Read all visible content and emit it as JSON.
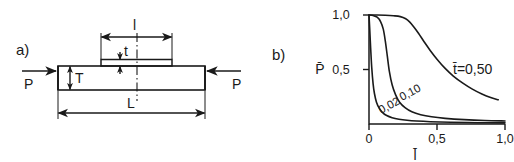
{
  "figure": {
    "panels": [
      {
        "tag": "a)",
        "kind": "engineering-diagram",
        "description": "Bar loaded in compression with a raised strip on the top surface",
        "labels": {
          "load_left": "P",
          "load_right": "P",
          "bar_thickness": "T",
          "strip_thickness": "t",
          "strip_length": "l",
          "bar_length": "L"
        }
      },
      {
        "tag": "b)",
        "kind": "line-chart"
      }
    ]
  },
  "chart_data": {
    "type": "line",
    "title": "",
    "xlabel": "l̄",
    "ylabel": "P̄",
    "xlim": [
      0,
      1.0
    ],
    "ylim": [
      0,
      1.0
    ],
    "grid": false,
    "legend_position": "inline-annotations",
    "xticks": [
      0,
      0.5,
      1.0
    ],
    "xtick_labels": [
      "0",
      "0,5",
      "1,0"
    ],
    "yticks": [
      0.5,
      1.0
    ],
    "ytick_labels": [
      "0,5",
      "1,0"
    ],
    "series": [
      {
        "name": "t̄ = 0,02",
        "annotation": "0,02",
        "x": [
          0.0,
          0.005,
          0.012,
          0.02,
          0.03,
          0.04,
          0.055,
          0.075,
          0.1,
          0.13,
          0.17,
          0.22,
          0.28,
          0.35,
          0.45,
          0.6,
          0.8,
          1.0
        ],
        "y": [
          1.0,
          0.88,
          0.7,
          0.52,
          0.37,
          0.28,
          0.2,
          0.145,
          0.105,
          0.078,
          0.058,
          0.044,
          0.034,
          0.027,
          0.021,
          0.016,
          0.012,
          0.01
        ]
      },
      {
        "name": "t̄ = 0,10",
        "annotation": "0,10",
        "x": [
          0.0,
          0.03,
          0.06,
          0.085,
          0.105,
          0.12,
          0.135,
          0.15,
          0.17,
          0.195,
          0.225,
          0.265,
          0.315,
          0.38,
          0.46,
          0.56,
          0.7,
          0.85,
          1.0
        ],
        "y": [
          1.0,
          0.995,
          0.98,
          0.94,
          0.87,
          0.76,
          0.62,
          0.48,
          0.36,
          0.27,
          0.2,
          0.15,
          0.112,
          0.085,
          0.066,
          0.052,
          0.04,
          0.032,
          0.028
        ]
      },
      {
        "name": "t̄ = 0,50",
        "annotation": "t̄=0,50",
        "x": [
          0.0,
          0.06,
          0.12,
          0.18,
          0.23,
          0.27,
          0.3,
          0.33,
          0.365,
          0.405,
          0.45,
          0.5,
          0.56,
          0.62,
          0.69,
          0.76,
          0.83,
          0.9,
          0.95
        ],
        "y": [
          1.0,
          1.0,
          0.998,
          0.993,
          0.985,
          0.965,
          0.935,
          0.89,
          0.83,
          0.755,
          0.675,
          0.595,
          0.51,
          0.44,
          0.375,
          0.32,
          0.275,
          0.24,
          0.222
        ]
      }
    ]
  }
}
